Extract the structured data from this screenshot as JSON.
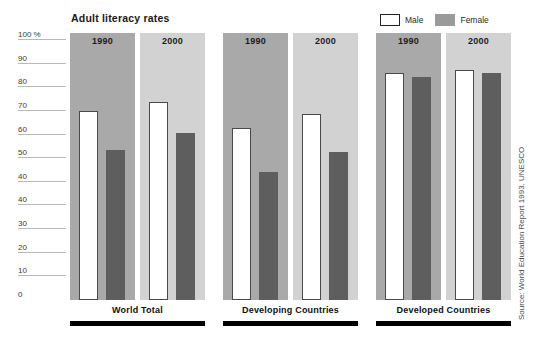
{
  "chart_data": {
    "type": "bar",
    "title": "Adult literacy rates",
    "xlabel": "",
    "ylabel": "",
    "ylim": [
      0,
      100
    ],
    "grid": true,
    "legend_position": "top-right",
    "y_unit": "%",
    "y_ticks": [
      "100 %",
      "90",
      "80",
      "70",
      "60",
      "50",
      "40",
      "40",
      "30",
      "20",
      "10",
      "0"
    ],
    "y_tick_values": [
      100,
      90,
      80,
      70,
      60,
      50,
      40,
      40,
      30,
      20,
      10,
      0
    ],
    "legend": [
      {
        "name": "Male",
        "color": "#ffffff"
      },
      {
        "name": "Female",
        "color": "#5e5e5e"
      }
    ],
    "series": [
      {
        "name": "Male",
        "values": [
          78,
          82,
          71,
          77,
          94,
          95
        ]
      },
      {
        "name": "Female",
        "values": [
          62,
          69,
          53,
          61,
          92,
          94
        ]
      }
    ],
    "categories": [
      "World Total 1990",
      "World Total 2000",
      "Developing Countries 1990",
      "Developing Countries 2000",
      "Developed Countries 1990",
      "Developed Countries 2000"
    ],
    "groups": [
      {
        "label": "World Total",
        "panels": [
          {
            "year": "1990",
            "shade": "dark",
            "male": 78,
            "female": 62
          },
          {
            "year": "2000",
            "shade": "light",
            "male": 82,
            "female": 69
          }
        ]
      },
      {
        "label": "Developing Countries",
        "panels": [
          {
            "year": "1990",
            "shade": "dark",
            "male": 71,
            "female": 53
          },
          {
            "year": "2000",
            "shade": "light",
            "male": 77,
            "female": 61
          }
        ]
      },
      {
        "label": "Developed Countries",
        "panels": [
          {
            "year": "1990",
            "shade": "dark",
            "male": 94,
            "female": 92
          },
          {
            "year": "2000",
            "shade": "light",
            "male": 95,
            "female": 94
          }
        ]
      }
    ],
    "source": "Source: World Education Report 1993. UNESCO",
    "colors": {
      "panel_1990": "#a9a9a9",
      "panel_2000": "#d2d2d2",
      "male_bar": "#ffffff",
      "male_bar_border": "#4a4a4a",
      "female_bar": "#5e5e5e",
      "gridline": "#b9b9b9",
      "group_rule": "#000000"
    }
  }
}
